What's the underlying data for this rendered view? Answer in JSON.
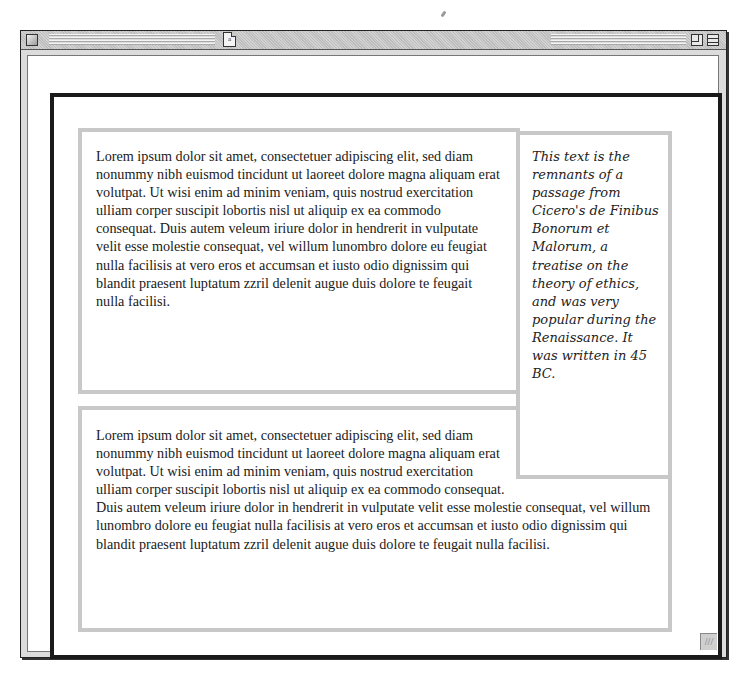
{
  "window": {
    "title_icon": "document-icon",
    "title_icon_glyph": "a",
    "controls": {
      "close": "close-box",
      "zoom": "zoom-box",
      "collapse": "collapse-box",
      "resize": "resize-grip"
    },
    "resize_glyph": "///"
  },
  "main": {
    "paragraph_1": "Lorem ipsum dolor sit amet, consectetuer adipiscing elit, sed diam nonummy nibh euismod tincidunt ut laoreet dolore magna aliquam erat volutpat. Ut wisi enim ad minim veniam, quis nostrud exercitation ulliam corper suscipit lobortis nisl ut aliquip ex ea commodo consequat. Duis autem veleum iriure dolor in hendrerit in vulputate velit esse molestie consequat, vel willum lunombro dolore eu feugiat nulla facilisis at vero eros et accumsan et iusto odio dignissim qui blandit praesent luptatum zzril delenit augue duis dolore te feugait nulla facilisi.",
    "paragraph_2": "Lorem ipsum dolor sit amet, consectetuer adipiscing elit, sed diam nonummy nibh euismod tincidunt ut laoreet dolore magna aliquam erat volutpat. Ut wisi enim ad minim veniam, quis nostrud exercitation ulliam corper suscipit lobortis nisl ut aliquip ex ea commodo consequat. Duis autem veleum iriure dolor in hendrerit in vulputate velit esse molestie consequat, vel willum lunombro dolore eu feugiat nulla facilisis at vero eros et accumsan et iusto odio dignissim qui blandit praesent luptatum zzril delenit augue duis dolore te feugait nulla facilisi.",
    "aside": "This text is the remnants of a passage from Cicero's de Finibus Bonorum et Malorum, a treatise on the theory of ethics, and was very popular during the Renaissance. It was written in 45 BC."
  },
  "colors": {
    "outer_border": "#1a1a1a",
    "box_border": "#c8c8c8",
    "text": "#1a1a1a",
    "window_chrome": "#dcdcdc"
  }
}
